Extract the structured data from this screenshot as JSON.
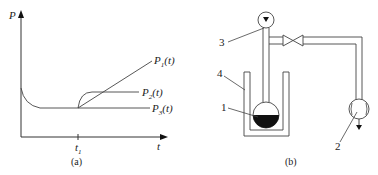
{
  "panel_a": {
    "caption": "(a)",
    "y_axis_label": "P",
    "x_axis_label": "t",
    "tick_label": "t",
    "tick_sub": "1",
    "curves": [
      {
        "name": "P",
        "sub": "1",
        "arg": "(t)"
      },
      {
        "name": "P",
        "sub": "2",
        "arg": "(t)"
      },
      {
        "name": "P",
        "sub": "3",
        "arg": "(t)"
      }
    ]
  },
  "panel_b": {
    "caption": "(b)",
    "callouts": [
      "1",
      "2",
      "3",
      "4"
    ]
  }
}
